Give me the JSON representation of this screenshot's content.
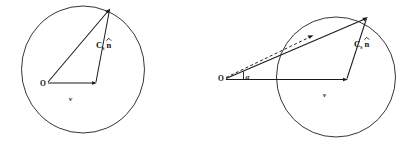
{
  "figure": {
    "type": "vector-diagram-pair",
    "background_color": "#ffffff",
    "line_color": "#1a1a1a",
    "panels": [
      {
        "id": "left",
        "name": "stationary-source-diagram",
        "circle": {
          "cx": 83,
          "cy": 69,
          "r": 63
        },
        "origin_label": "O",
        "origin_point": {
          "x": 46,
          "y": 83
        },
        "velocity_label": "v",
        "velocity_label_pos": {
          "x": 71,
          "y": 99
        },
        "velocity_tip": {
          "x": 97,
          "y": 83
        },
        "apex_point": {
          "x": 110,
          "y": 9
        },
        "wave_label_c": "C",
        "wave_label_sub": "s",
        "wave_label_n": "n",
        "wave_label_pos": {
          "x": 100,
          "y": 46
        }
      },
      {
        "id": "right",
        "name": "moving-source-diagram",
        "circle": {
          "cx": 336,
          "cy": 76,
          "r": 60
        },
        "origin_label": "O",
        "origin_point": {
          "x": 224,
          "y": 79
        },
        "velocity_label": "v",
        "velocity_label_pos": {
          "x": 325,
          "y": 95
        },
        "velocity_tip": {
          "x": 348,
          "y": 79
        },
        "apex_point": {
          "x": 367,
          "y": 17
        },
        "dashed_tip": {
          "x": 313,
          "y": 35
        },
        "angle_label": "α",
        "angle_label_pos": {
          "x": 245,
          "y": 77
        },
        "wave_label_c": "C",
        "wave_label_sub": "s",
        "wave_label_n": "n",
        "wave_label_pos": {
          "x": 358,
          "y": 45
        }
      }
    ]
  }
}
